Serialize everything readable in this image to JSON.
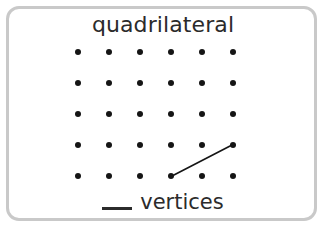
{
  "card": {
    "title": "quadrilateral",
    "border_color": "#c9c9c9",
    "background_color": "#ffffff"
  },
  "geoboard": {
    "rows": 5,
    "columns": 6,
    "dot_color": "#151515",
    "dot_radius_px": 3,
    "origin_x": 78,
    "origin_y": 52,
    "spacing_x": 31,
    "spacing_y": 31,
    "segments": [
      {
        "name": "drawn-segment",
        "from_col": 4,
        "from_row": 5,
        "to_col": 6,
        "to_row": 4,
        "x1": 172,
        "y1": 176,
        "x2": 232,
        "y2": 145,
        "color": "#151515",
        "width": 1.6
      }
    ]
  },
  "prompt": {
    "blank": "",
    "label": "vertices",
    "full_text": "__ vertices"
  }
}
